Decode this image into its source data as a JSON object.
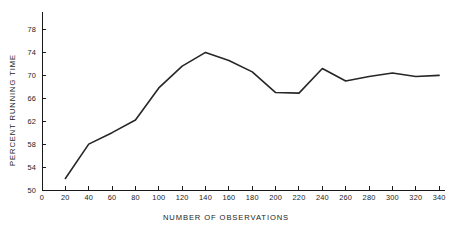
{
  "chart_data": {
    "type": "line",
    "title": "",
    "xlabel": "NUMBER OF OBSERVATIONS",
    "ylabel": "PERCENT RUNNING TIME",
    "xlim": [
      0,
      345
    ],
    "ylim": [
      50,
      80
    ],
    "grid": false,
    "legend": null,
    "x": [
      20,
      40,
      60,
      80,
      100,
      120,
      140,
      160,
      180,
      200,
      220,
      240,
      260,
      280,
      300,
      320,
      340
    ],
    "values": [
      52.0,
      58.0,
      60.0,
      62.2,
      67.8,
      71.6,
      74.0,
      72.6,
      70.6,
      67.0,
      66.9,
      71.2,
      69.0,
      69.8,
      70.4,
      69.8,
      70.0
    ],
    "x_ticks": [
      0,
      20,
      40,
      60,
      80,
      100,
      120,
      140,
      160,
      180,
      200,
      220,
      240,
      260,
      280,
      300,
      320,
      340
    ],
    "x_tick_labels": [
      "0",
      "20",
      "40",
      "60",
      "80",
      "100",
      "120",
      "140",
      "160",
      "180",
      "200",
      "220",
      "240",
      "260",
      "280",
      "300",
      "320",
      "340"
    ],
    "y_ticks": [
      50,
      54,
      58,
      62,
      66,
      70,
      74,
      78
    ],
    "y_tick_labels": [
      "50",
      "54",
      "58",
      "62",
      "66",
      "70",
      "74",
      "78"
    ],
    "line_color": "#262626",
    "axis_color": "#1a1a1a",
    "background_color": "#ffffff"
  }
}
